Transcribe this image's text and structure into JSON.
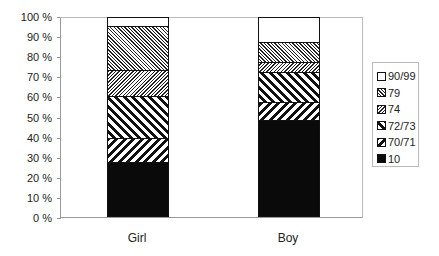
{
  "chart_data": {
    "type": "bar",
    "stacked": true,
    "percent_stacked": true,
    "title": "",
    "xlabel": "",
    "ylabel": "",
    "ylim": [
      0,
      100
    ],
    "y_ticks": [
      "0 %",
      "10 %",
      "20 %",
      "30 %",
      "40 %",
      "50 %",
      "60 %",
      "70 %",
      "80 %",
      "90 %",
      "100 %"
    ],
    "categories": [
      "Girl",
      "Boy"
    ],
    "series": [
      {
        "name": "10",
        "values": [
          27,
          48
        ]
      },
      {
        "name": "70/71",
        "values": [
          12,
          9
        ]
      },
      {
        "name": "72/73",
        "values": [
          21,
          15
        ]
      },
      {
        "name": "74",
        "values": [
          13,
          5
        ]
      },
      {
        "name": "79",
        "values": [
          22,
          10
        ]
      },
      {
        "name": "90/99",
        "values": [
          5,
          13
        ]
      }
    ],
    "legend_position": "right",
    "legend_order": [
      "90/99",
      "79",
      "74",
      "72/73",
      "70/71",
      "10"
    ],
    "grid": false
  },
  "legend": {
    "items": [
      {
        "label": "90/99",
        "pattern": "p-white"
      },
      {
        "label": "79",
        "pattern": "p-79"
      },
      {
        "label": "74",
        "pattern": "p-74"
      },
      {
        "label": "72/73",
        "pattern": "p-72"
      },
      {
        "label": "70/71",
        "pattern": "p-70"
      },
      {
        "label": "10",
        "pattern": "p-10"
      }
    ]
  }
}
